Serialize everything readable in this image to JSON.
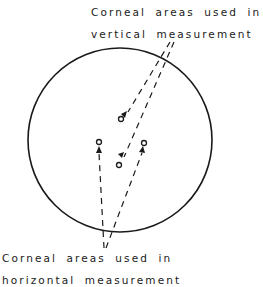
{
  "diagram": {
    "labels": {
      "vertical": {
        "line1": "Corneal areas used in",
        "line2": "vertical measurement"
      },
      "horizontal": {
        "line1": "Corneal areas used in",
        "line2": "horizontal measurement"
      }
    },
    "cornea_outline": {
      "shape": "circle",
      "cx": 120,
      "cy": 140,
      "r": 92
    },
    "measurement_points": [
      {
        "id": "vertical-upper",
        "x": 121,
        "y": 119,
        "group": "vertical"
      },
      {
        "id": "vertical-lower",
        "x": 119,
        "y": 165,
        "group": "vertical"
      },
      {
        "id": "horizontal-left",
        "x": 99,
        "y": 142,
        "group": "horizontal"
      },
      {
        "id": "horizontal-right",
        "x": 144,
        "y": 143,
        "group": "horizontal"
      }
    ],
    "colors": {
      "stroke": "#1a1a1a",
      "background": "#ffffff"
    }
  }
}
